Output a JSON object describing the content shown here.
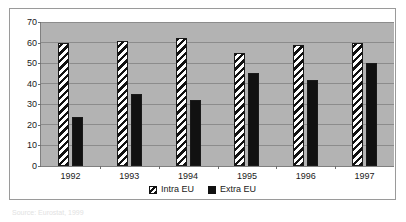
{
  "chart_data": {
    "type": "bar",
    "title": "",
    "xlabel": "",
    "ylabel": "",
    "categories": [
      "1992",
      "1993",
      "1994",
      "1995",
      "1996",
      "1997"
    ],
    "series": [
      {
        "name": "Intra EU",
        "values": [
          60,
          61,
          62,
          55,
          59,
          60
        ]
      },
      {
        "name": "Extra EU",
        "values": [
          24,
          35,
          32,
          45,
          42,
          50
        ]
      }
    ],
    "ylim": [
      0,
      70
    ],
    "ytick_values": [
      0,
      10,
      20,
      30,
      40,
      50,
      60,
      70
    ],
    "ytick_labels": [
      "0",
      "10",
      "20",
      "30",
      "40",
      "50",
      "60",
      "70"
    ],
    "grid": true,
    "legend_position": "bottom",
    "plot_background": "#b3b3b3",
    "series_colors": [
      "#ffffff",
      "#111111"
    ]
  },
  "legend": {
    "items": [
      {
        "label": "Intra EU",
        "pattern": "diagonal-hatch"
      },
      {
        "label": "Extra EU",
        "pattern": "solid"
      }
    ]
  },
  "caption": {
    "text": "Source: Eurostat, 1999"
  }
}
